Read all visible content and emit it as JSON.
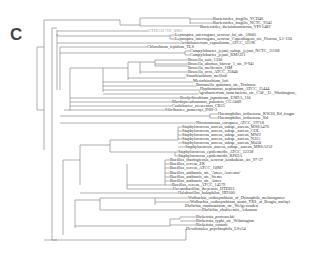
{
  "panel_label": "C",
  "tree": {
    "title": "Phylogenetic tree",
    "line_color": "#8a8a8a",
    "leaves": [
      {
        "label": "Bacteroides_fragilis_YCH46",
        "x": 213,
        "y": 19
      },
      {
        "label": "Bacteroides_fragilis_NCTC_9343",
        "x": 213,
        "y": 23
      },
      {
        "label": "Bacteroides_thetaiotaomicron_VPI-5482",
        "x": 200,
        "y": 27
      },
      {
        "label": "GTHG3171N_8985",
        "x": 148,
        "y": 31,
        "style": "gray"
      },
      {
        "label": "Leptospira_interrogans_serovar_lai_str._56601",
        "x": 175,
        "y": 35
      },
      {
        "label": "Leptospira_interrogans_serovar_Copenhageni_str._Fiocruz_L1-130",
        "x": 175,
        "y": 39
      },
      {
        "label": "Acidobacterium_capsulatum_ATCC_51196",
        "x": 180,
        "y": 43
      },
      {
        "label": "Chlorobium_tepidum_TLS",
        "x": 147,
        "y": 47
      },
      {
        "label": "Campylobacter_jejuni_subsp._jejuni_NCTC_11168",
        "x": 190,
        "y": 51
      },
      {
        "label": "Campylobacter_jejuni_RM1221",
        "x": 190,
        "y": 55
      },
      {
        "label": "Brucella_suis_1330",
        "x": 188,
        "y": 60
      },
      {
        "label": "Brucella_abortus_biovar_1_str._9-941",
        "x": 188,
        "y": 64
      },
      {
        "label": "Brucella_melitensis_16M",
        "x": 188,
        "y": 68
      },
      {
        "label": "Brucella_ovis_ATCC_25840",
        "x": 188,
        "y": 72
      },
      {
        "label": "Sinorhizobium_meliloti",
        "x": 186,
        "y": 76
      },
      {
        "label": "Mesorhizobium_loti",
        "x": 193,
        "y": 81
      },
      {
        "label": "Bartonella_quintana_str._Toulouse",
        "x": 196,
        "y": 85
      },
      {
        "label": "Hyphomonas_neptunium_ATCC_15444",
        "x": 200,
        "y": 89
      },
      {
        "label": "Agrobacterium_tumefaciens_str._C58__U._Washington_",
        "x": 198,
        "y": 93
      },
      {
        "label": "Bradyrhizobium_japonicum_USDA_110",
        "x": 180,
        "y": 98
      },
      {
        "label": "Rhodopseudomonas_palustris_CGA009",
        "x": 172,
        "y": 102
      },
      {
        "label": "Caulobacter_crescentus_CB15",
        "x": 172,
        "y": 106
      },
      {
        "label": "Silicibacter_pomeroyi_DSS-3",
        "x": 165,
        "y": 110
      },
      {
        "label": "Haemophilus_influenzae_KW20_Rd_fragm",
        "x": 218,
        "y": 114
      },
      {
        "label": "Haemophilus_influenzae_Rd",
        "x": 218,
        "y": 118
      },
      {
        "label": "Nitrosomonas_europaea_ATCC_19718",
        "x": 196,
        "y": 123
      },
      {
        "label": "Staphylococcus_aureus_subsp._aureus_MSSA476",
        "x": 182,
        "y": 127
      },
      {
        "label": "Staphylococcus_aureus_subsp._aureus_COL",
        "x": 182,
        "y": 131
      },
      {
        "label": "Staphylococcus_aureus_subsp._aureus_MW2",
        "x": 182,
        "y": 135
      },
      {
        "label": "Staphylococcus_aureus_subsp._aureus_N315",
        "x": 182,
        "y": 139
      },
      {
        "label": "Staphylococcus_aureus_subsp._aureus_Mu50",
        "x": 182,
        "y": 143
      },
      {
        "label": "Staphylococcus_aureus_subsp._aureus_MRSA252",
        "x": 185,
        "y": 147
      },
      {
        "label": "Staphylococcus_epidermidis_ATCC_12228",
        "x": 178,
        "y": 152
      },
      {
        "label": "Staphylococcus_epidermidis_RP62A",
        "x": 178,
        "y": 156
      },
      {
        "label": "Bacillus_thuringiensis_serovar_konkukian_str._97-27",
        "x": 170,
        "y": 160
      },
      {
        "label": "Bacillus_cereus_ZK",
        "x": 170,
        "y": 164
      },
      {
        "label": "Bacillus_cereus_ATCC_10987",
        "x": 170,
        "y": 168
      },
      {
        "label": "Bacillus_anthracis_str._'Ames_Ancestor'",
        "x": 170,
        "y": 173
      },
      {
        "label": "Bacillus_anthracis_str._Sterne",
        "x": 170,
        "y": 177
      },
      {
        "label": "Bacillus_anthracis_str._Ames",
        "x": 170,
        "y": 181
      },
      {
        "label": "Bacillus_cereus_ATCC_14579",
        "x": 172,
        "y": 185
      },
      {
        "label": "Oceanobacillus_iheyensis_HTE831",
        "x": 173,
        "y": 189
      },
      {
        "label": "Bacillus_halodurans_C-125 / Halobacillus_halophilus_HD100",
        "x": 178,
        "y": 193,
        "display": "Halobacillus_halophilus_HD100"
      },
      {
        "label": "Wolbachia_endosymbiont_of_Drosophila_melanogaster",
        "x": 188,
        "y": 198
      },
      {
        "label": "Wolbachia_endosymbiont_strain_TRS_of_Brugia_malayi",
        "x": 190,
        "y": 202
      },
      {
        "label": "Ehrlichia_ruminantium_str._Welgevonden",
        "x": 185,
        "y": 206
      },
      {
        "label": "Ehrlichia_chaffeensis_Arkansas",
        "x": 202,
        "y": 210
      },
      {
        "label": "Rickettsia_prowazekii",
        "x": 196,
        "y": 217
      },
      {
        "label": "Rickettsia_typhi_str._Wilmington",
        "x": 196,
        "y": 221
      },
      {
        "label": "Rickettsia_conorii",
        "x": 196,
        "y": 225
      },
      {
        "label": "Desulfotalea_psychrophila_LSv54",
        "x": 186,
        "y": 229
      }
    ]
  }
}
